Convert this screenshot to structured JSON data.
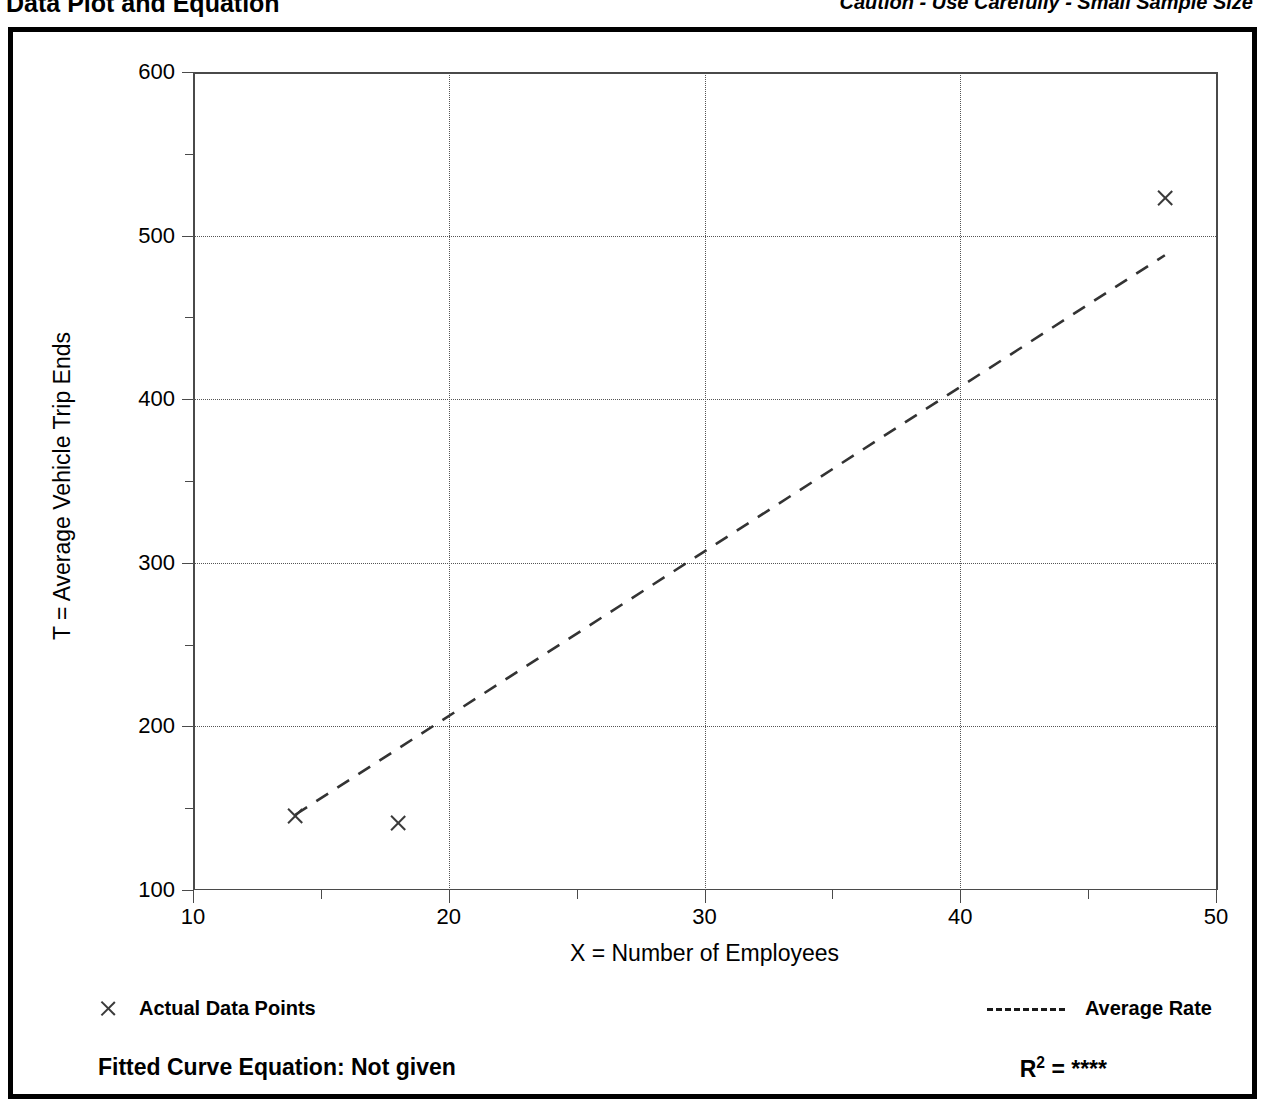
{
  "header": {
    "title": "Data Plot and Equation",
    "caution": "Caution - Use Carefully - Small Sample Size"
  },
  "legend": {
    "data_points_label": "Actual Data Points",
    "average_rate_label": "Average Rate",
    "marker_icon": "x-marker-icon",
    "line_icon": "dashed-line-icon"
  },
  "equation": {
    "fitted_label": "Fitted Curve Equation:  Not given",
    "r_squared_prefix": "R",
    "r_squared_exponent": "2",
    "r_squared_value": "= ****"
  },
  "colors": {
    "frame": "#000000",
    "axis": "#4a4a4a",
    "grid": "#555555",
    "marker": "#3a3a3a",
    "trend": "#333333",
    "background": "#ffffff"
  },
  "chart_data": {
    "type": "scatter",
    "title": "Data Plot and Equation",
    "xlabel": "X = Number of Employees",
    "ylabel": "T = Average Vehicle Trip Ends",
    "xlim": [
      10,
      50
    ],
    "ylim": [
      100,
      600
    ],
    "xticks": [
      10,
      20,
      30,
      40,
      50
    ],
    "xtick_labels": [
      "10",
      "20",
      "30",
      "40",
      "50"
    ],
    "xminor_ticks": [
      15,
      25,
      35,
      45
    ],
    "yticks": [
      100,
      200,
      300,
      400,
      500,
      600
    ],
    "ytick_labels": [
      "100",
      "200",
      "300",
      "400",
      "500",
      "600"
    ],
    "yminor_ticks": [
      150,
      250,
      350,
      450,
      550
    ],
    "grid": true,
    "grid_style": "dotted",
    "legend_position": "below-axes",
    "series": [
      {
        "name": "Actual Data Points",
        "type": "scatter",
        "marker": "x",
        "points": [
          {
            "x": 14,
            "y": 145
          },
          {
            "x": 18,
            "y": 141
          },
          {
            "x": 48,
            "y": 523
          }
        ]
      },
      {
        "name": "Average Rate",
        "type": "line",
        "style": "dashed",
        "points": [
          {
            "x": 14,
            "y": 146
          },
          {
            "x": 48,
            "y": 488
          }
        ]
      }
    ],
    "annotations": [
      "Fitted Curve Equation:  Not given",
      "R2 = ****"
    ]
  }
}
